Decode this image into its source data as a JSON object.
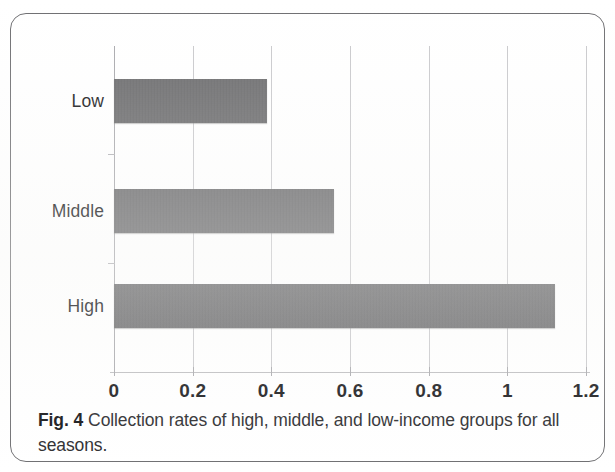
{
  "figure": {
    "caption_prefix": "Fig. 4",
    "caption_text": "Collection rates of high, middle, and low-income groups for all seasons.",
    "border_color": "#6f6f72"
  },
  "chart_data": {
    "type": "bar",
    "orientation": "horizontal",
    "title": "",
    "xlabel": "",
    "ylabel": "",
    "categories": [
      "Low",
      "Middle",
      "High"
    ],
    "values": [
      0.39,
      0.56,
      1.12
    ],
    "series": [
      {
        "name": "Collection rate",
        "values": [
          0.39,
          0.56,
          1.12
        ],
        "color": "#6b6b6d"
      }
    ],
    "xlim": [
      0,
      1.2
    ],
    "xticks": [
      0,
      0.2,
      0.4,
      0.6,
      0.8,
      1,
      1.2
    ],
    "xtick_labels": [
      "0",
      "0.2",
      "0.4",
      "0.6",
      "0.8",
      "1",
      "1.2"
    ],
    "grid": "vertical",
    "legend": "none",
    "bar_color": "#6b6b6d",
    "gridline_color": "#c9c9cc"
  },
  "axis": {
    "x_tick_0": "0",
    "x_tick_1": "0.2",
    "x_tick_2": "0.4",
    "x_tick_3": "0.6",
    "x_tick_4": "0.8",
    "x_tick_5": "1",
    "x_tick_6": "1.2",
    "y_cat_0": "Low",
    "y_cat_1": "Middle",
    "y_cat_2": "High"
  }
}
